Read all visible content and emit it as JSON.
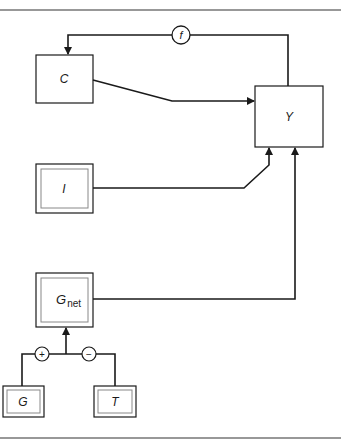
{
  "diagram": {
    "type": "block-flow",
    "nodes": {
      "C": {
        "label": "C",
        "style": "single"
      },
      "Y": {
        "label": "Y",
        "style": "single"
      },
      "I": {
        "label": "I",
        "style": "double"
      },
      "Gnet": {
        "label": "G",
        "subscript": "net",
        "style": "double"
      },
      "G": {
        "label": "G",
        "style": "double"
      },
      "T": {
        "label": "T",
        "style": "double"
      }
    },
    "operators": {
      "f": {
        "label": "f"
      },
      "plus": {
        "label": "+"
      },
      "minus": {
        "label": "−"
      }
    },
    "edges": [
      {
        "from": "Y",
        "to": "C",
        "via": "f"
      },
      {
        "from": "C",
        "to": "Y"
      },
      {
        "from": "I",
        "to": "Y"
      },
      {
        "from": "Gnet",
        "to": "Y"
      },
      {
        "from": "G",
        "to": "Gnet",
        "via": "plus"
      },
      {
        "from": "T",
        "to": "Gnet",
        "via": "minus"
      }
    ],
    "colors": {
      "line": "#1a1a1a",
      "box_inner": "#777777",
      "background": "#ffffff"
    }
  }
}
